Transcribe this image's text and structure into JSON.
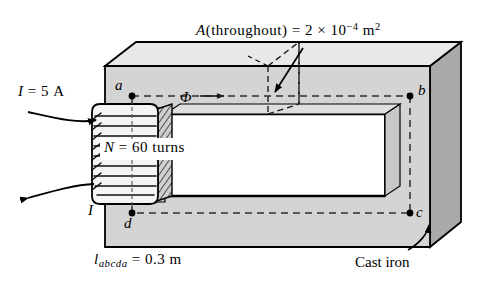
{
  "figure": {
    "type": "magnetic-circuit-diagram",
    "annotations": {
      "area": {
        "symbol": "A",
        "qualifier": "(throughout)",
        "equals": "=",
        "mantissa": "2",
        "times": "×",
        "base": "10",
        "exponent": "−4",
        "unit": "m",
        "unit_exponent": "2",
        "full_text": "A (throughout) = 2 × 10−4 m2"
      },
      "current": {
        "symbol": "I",
        "equals": "=",
        "value": "5",
        "unit": "A",
        "full_text": "I = 5 A"
      },
      "turns": {
        "symbol": "N",
        "equals": "=",
        "value": "60",
        "unit": "turns",
        "full_text": "N = 60 turns"
      },
      "length": {
        "symbol": "l",
        "subscript": "abcda",
        "equals": "=",
        "value": "0.3",
        "unit": "m",
        "full_text": "labcda = 0.3 m"
      },
      "material": "Cast iron",
      "flux_symbol": "Φ"
    },
    "nodes": {
      "a": "a",
      "b": "b",
      "c": "c",
      "d": "d",
      "return_current": "I"
    },
    "colors": {
      "top_face": "#e6e6e6",
      "front_face": "#d2d2d2",
      "side_face": "#a9a9a9",
      "window": "#ffffff",
      "outline": "#000000",
      "dashed_path": "#3a3a3a",
      "coil_fill": "#f2f2f2"
    }
  }
}
